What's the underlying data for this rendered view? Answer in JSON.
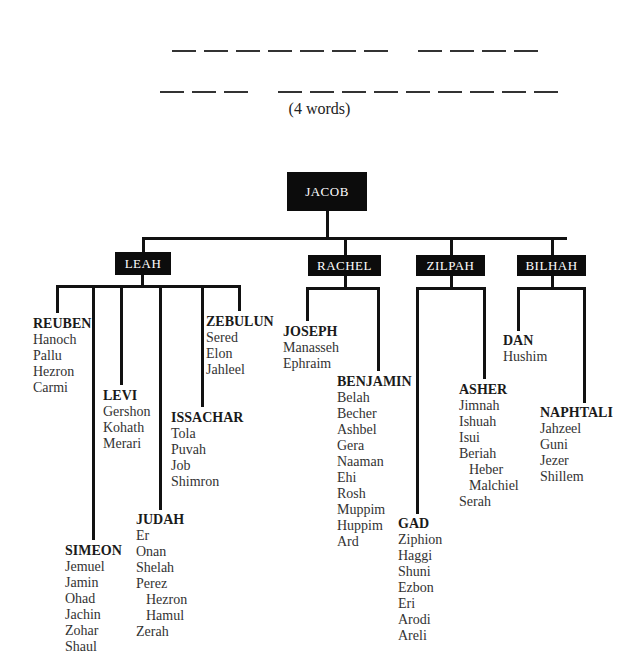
{
  "puzzle": {
    "line1_words": [
      7,
      4
    ],
    "line2_words": [
      3,
      9
    ],
    "hint": "(4 words)"
  },
  "tree": {
    "root": "JACOB",
    "wives": [
      "LEAH",
      "RACHEL",
      "ZILPAH",
      "BILHAH"
    ],
    "sons": {
      "reuben": {
        "name": "REUBEN",
        "children": [
          "Hanoch",
          "Pallu",
          "Hezron",
          "Carmi"
        ]
      },
      "simeon": {
        "name": "SIMEON",
        "children": [
          "Jemuel",
          "Jamin",
          "Ohad",
          "Jachin",
          "Zohar",
          "Shaul"
        ]
      },
      "levi": {
        "name": "LEVI",
        "children": [
          "Gershon",
          "Kohath",
          "Merari"
        ]
      },
      "judah": {
        "name": "JUDAH",
        "children": [
          "Er",
          "Onan",
          "Shelah",
          "Perez",
          "Hezron",
          "Hamul",
          "Zerah"
        ]
      },
      "issachar": {
        "name": "ISSACHAR",
        "children": [
          "Tola",
          "Puvah",
          "Job",
          "Shimron"
        ]
      },
      "zebulun": {
        "name": "ZEBULUN",
        "children": [
          "Sered",
          "Elon",
          "Jahleel"
        ]
      },
      "joseph": {
        "name": "JOSEPH",
        "children": [
          "Manasseh",
          "Ephraim"
        ]
      },
      "benjamin": {
        "name": "BENJAMIN",
        "children": [
          "Belah",
          "Becher",
          "Ashbel",
          "Gera",
          "Naaman",
          "Ehi",
          "Rosh",
          "Muppim",
          "Huppim",
          "Ard"
        ]
      },
      "gad": {
        "name": "GAD",
        "children": [
          "Ziphion",
          "Haggi",
          "Shuni",
          "Ezbon",
          "Eri",
          "Arodi",
          "Areli"
        ]
      },
      "asher": {
        "name": "ASHER",
        "children": [
          "Jimnah",
          "Ishuah",
          "Isui",
          "Beriah",
          "Heber",
          "Malchiel",
          "Serah"
        ]
      },
      "dan": {
        "name": "DAN",
        "children": [
          "Hushim"
        ]
      },
      "naphtali": {
        "name": "NAPHTALI",
        "children": [
          "Jahzeel",
          "Guni",
          "Jezer",
          "Shillem"
        ]
      }
    }
  }
}
